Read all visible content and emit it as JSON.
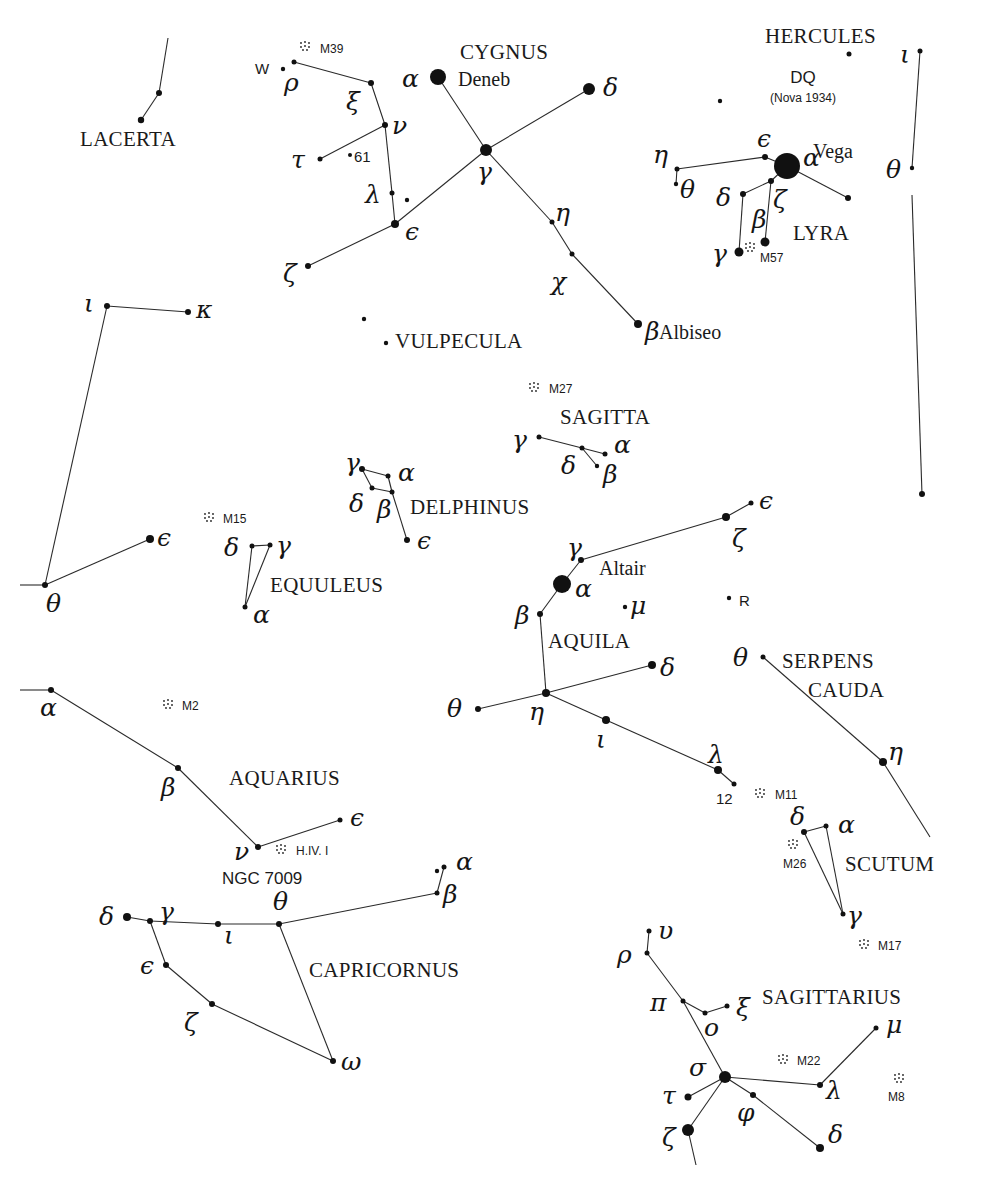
{
  "constellations": [
    {
      "name": "LACERTA",
      "x": 80,
      "y": 146
    },
    {
      "name": "CYGNUS",
      "x": 460,
      "y": 59
    },
    {
      "name": "HERCULES",
      "x": 765,
      "y": 43
    },
    {
      "name": "LYRA",
      "x": 793,
      "y": 240
    },
    {
      "name": "VULPECULA",
      "x": 395,
      "y": 348
    },
    {
      "name": "SAGITTA",
      "x": 560,
      "y": 424
    },
    {
      "name": "DELPHINUS",
      "x": 410,
      "y": 514
    },
    {
      "name": "EQUULEUS",
      "x": 270,
      "y": 592
    },
    {
      "name": "AQUILA",
      "x": 548,
      "y": 648
    },
    {
      "name": "SERPENS",
      "x": 782,
      "y": 668
    },
    {
      "name": "CAUDA",
      "x": 808,
      "y": 697
    },
    {
      "name": "AQUARIUS",
      "x": 229,
      "y": 785
    },
    {
      "name": "SCUTUM",
      "x": 845,
      "y": 871
    },
    {
      "name": "CAPRICORNUS",
      "x": 309,
      "y": 977
    },
    {
      "name": "SAGITTARIUS",
      "x": 762,
      "y": 1004
    }
  ],
  "star_names": [
    {
      "name": "Deneb",
      "x": 458,
      "y": 86
    },
    {
      "name": "Vega",
      "x": 813,
      "y": 158
    },
    {
      "name": "Albiseo",
      "x": 659,
      "y": 339
    },
    {
      "name": "Altair",
      "x": 599,
      "y": 575
    }
  ],
  "variables": [
    {
      "name": "DQ",
      "x": 803,
      "y": 83,
      "cls": "big"
    },
    {
      "name": "(Nova 1934)",
      "x": 803,
      "y": 102,
      "cls": "sm"
    },
    {
      "name": "W",
      "x": 255,
      "y": 74,
      "cls": "smd"
    },
    {
      "name": "61",
      "x": 354,
      "y": 162,
      "cls": "smd"
    },
    {
      "name": "R",
      "x": 739,
      "y": 606,
      "cls": "smd"
    },
    {
      "name": "12",
      "x": 716,
      "y": 804,
      "cls": "smd"
    },
    {
      "name": "NGC 7009",
      "x": 222,
      "y": 884,
      "cls": "big"
    }
  ],
  "deep_sky": [
    {
      "label": "M39",
      "x": 305,
      "y": 46,
      "lx": 320,
      "ly": 53
    },
    {
      "label": "M57",
      "x": 750,
      "y": 247,
      "lx": 760,
      "ly": 262
    },
    {
      "label": "M27",
      "x": 534,
      "y": 387,
      "lx": 549,
      "ly": 393
    },
    {
      "label": "M15",
      "x": 209,
      "y": 517,
      "lx": 223,
      "ly": 523
    },
    {
      "label": "M2",
      "x": 168,
      "y": 704,
      "lx": 182,
      "ly": 710
    },
    {
      "label": "H.IV. I",
      "x": 281,
      "y": 849,
      "lx": 296,
      "ly": 855
    },
    {
      "label": "M11",
      "x": 760,
      "y": 793,
      "lx": 775,
      "ly": 799
    },
    {
      "label": "M26",
      "x": 793,
      "y": 844,
      "lx": 783,
      "ly": 868
    },
    {
      "label": "M17",
      "x": 864,
      "y": 944,
      "lx": 878,
      "ly": 950
    },
    {
      "label": "M22",
      "x": 783,
      "y": 1059,
      "lx": 797,
      "ly": 1065
    },
    {
      "label": "M8",
      "x": 899,
      "y": 1078,
      "lx": 888,
      "ly": 1101
    }
  ],
  "stars": [
    {
      "id": "lac1",
      "x": 159,
      "y": 93,
      "r": 3
    },
    {
      "id": "lac2",
      "x": 141,
      "y": 120,
      "r": 3.2
    },
    {
      "id": "cyg_w",
      "x": 283,
      "y": 69,
      "r": 2.2
    },
    {
      "id": "cyg_rho",
      "x": 294,
      "y": 62,
      "r": 2.5,
      "g": "ρ",
      "gx": 284,
      "gy": 91
    },
    {
      "id": "cyg_xi",
      "x": 371,
      "y": 83,
      "r": 3,
      "g": "ξ",
      "gx": 346,
      "gy": 110
    },
    {
      "id": "cyg_nu",
      "x": 385,
      "y": 125,
      "r": 3,
      "g": "ν",
      "gx": 392,
      "gy": 134
    },
    {
      "id": "cyg_tau",
      "x": 320,
      "y": 159,
      "r": 2.5,
      "g": "τ",
      "gx": 291,
      "gy": 168
    },
    {
      "id": "cyg_61",
      "x": 350,
      "y": 155,
      "r": 2
    },
    {
      "id": "cyg_lambda",
      "x": 392,
      "y": 193,
      "r": 2.5,
      "g": "λ",
      "gx": 365,
      "gy": 203
    },
    {
      "id": "cyg_x",
      "x": 407,
      "y": 200,
      "r": 2.2
    },
    {
      "id": "cyg_eps",
      "x": 395,
      "y": 224,
      "r": 4,
      "g": "ϵ",
      "gx": 405,
      "gy": 240
    },
    {
      "id": "cyg_zeta",
      "x": 308,
      "y": 266,
      "r": 3,
      "g": "ζ",
      "gx": 283,
      "gy": 282
    },
    {
      "id": "cyg_alpha",
      "x": 438,
      "y": 77,
      "r": 8,
      "g": "α",
      "gx": 402,
      "gy": 87
    },
    {
      "id": "cyg_gamma",
      "x": 486,
      "y": 150,
      "r": 6,
      "g": "γ",
      "gx": 477,
      "gy": 180
    },
    {
      "id": "cyg_delta",
      "x": 589,
      "y": 89,
      "r": 6,
      "g": "δ",
      "gx": 603,
      "gy": 96
    },
    {
      "id": "cyg_eta",
      "x": 552,
      "y": 222,
      "r": 2.5,
      "g": "η",
      "gx": 555,
      "gy": 221
    },
    {
      "id": "cyg_chi",
      "x": 572,
      "y": 254,
      "r": 2.5,
      "g": "χ",
      "gx": 551,
      "gy": 290
    },
    {
      "id": "cyg_beta",
      "x": 638,
      "y": 324,
      "r": 4,
      "g": "β",
      "gx": 645,
      "gy": 340
    },
    {
      "id": "her_dq",
      "x": 849,
      "y": 54,
      "r": 2.5
    },
    {
      "id": "her_x",
      "x": 720,
      "y": 101,
      "r": 2.2
    },
    {
      "id": "her_iota",
      "x": 920,
      "y": 51,
      "r": 2.5,
      "g": "ι",
      "gx": 900,
      "gy": 63
    },
    {
      "id": "her_theta",
      "x": 912,
      "y": 168,
      "r": 2.2,
      "g": "θ",
      "gx": 886,
      "gy": 178
    },
    {
      "id": "her_low",
      "x": 922,
      "y": 494,
      "r": 3
    },
    {
      "id": "lyr_alpha",
      "x": 787,
      "y": 166,
      "r": 13,
      "g": "α",
      "gx": 803,
      "gy": 166
    },
    {
      "id": "lyr_eps",
      "x": 765,
      "y": 157,
      "r": 3,
      "g": "ϵ",
      "gx": 757,
      "gy": 147
    },
    {
      "id": "lyr_eta",
      "x": 677,
      "y": 169,
      "r": 2.5,
      "g": "η",
      "gx": 653,
      "gy": 163
    },
    {
      "id": "lyr_theta",
      "x": 676,
      "y": 184,
      "r": 2.2,
      "g": "θ",
      "gx": 680,
      "gy": 198
    },
    {
      "id": "lyr_zeta",
      "x": 771,
      "y": 181,
      "r": 3,
      "g": "ζ",
      "gx": 773,
      "gy": 208
    },
    {
      "id": "lyr_delta",
      "x": 743,
      "y": 194,
      "r": 3,
      "g": "δ",
      "gx": 716,
      "gy": 206
    },
    {
      "id": "lyr_epsx",
      "x": 848,
      "y": 198,
      "r": 3
    },
    {
      "id": "lyr_gamma",
      "x": 739,
      "y": 252,
      "r": 4.5,
      "g": "γ",
      "gx": 712,
      "gy": 262
    },
    {
      "id": "lyr_beta",
      "x": 765,
      "y": 242,
      "r": 4.5,
      "g": "β",
      "gx": 752,
      "gy": 228
    },
    {
      "id": "peg_iota",
      "x": 107,
      "y": 306,
      "r": 3,
      "g": "ι",
      "gx": 84,
      "gy": 312
    },
    {
      "id": "peg_kappa",
      "x": 188,
      "y": 312,
      "r": 3,
      "g": "κ",
      "gx": 196,
      "gy": 318
    },
    {
      "id": "peg_eps",
      "x": 150,
      "y": 539,
      "r": 4,
      "g": "ϵ",
      "gx": 157,
      "gy": 546
    },
    {
      "id": "peg_theta",
      "x": 45,
      "y": 585,
      "r": 3,
      "g": "θ",
      "gx": 46,
      "gy": 612
    },
    {
      "id": "vul1",
      "x": 364,
      "y": 319,
      "r": 2.2
    },
    {
      "id": "vul2",
      "x": 386,
      "y": 343,
      "r": 2.2
    },
    {
      "id": "sge_gamma",
      "x": 539,
      "y": 437,
      "r": 2.5,
      "g": "γ",
      "gx": 512,
      "gy": 448
    },
    {
      "id": "sge_delta",
      "x": 582,
      "y": 448,
      "r": 2.5,
      "g": "δ",
      "gx": 561,
      "gy": 474
    },
    {
      "id": "sge_alpha",
      "x": 605,
      "y": 454,
      "r": 2.5,
      "g": "α",
      "gx": 614,
      "gy": 453
    },
    {
      "id": "sge_beta",
      "x": 597,
      "y": 466,
      "r": 2.2,
      "g": "β",
      "gx": 603,
      "gy": 483
    },
    {
      "id": "del_gamma",
      "x": 362,
      "y": 469,
      "r": 3,
      "g": "γ",
      "gx": 345,
      "gy": 471
    },
    {
      "id": "del_alpha",
      "x": 388,
      "y": 476,
      "r": 2.5,
      "g": "α",
      "gx": 398,
      "gy": 481
    },
    {
      "id": "del_delta",
      "x": 372,
      "y": 488,
      "r": 2.5,
      "g": "δ",
      "gx": 349,
      "gy": 512
    },
    {
      "id": "del_beta",
      "x": 392,
      "y": 492,
      "r": 2.5,
      "g": "β",
      "gx": 377,
      "gy": 518
    },
    {
      "id": "del_eps",
      "x": 407,
      "y": 540,
      "r": 3,
      "g": "ϵ",
      "gx": 417,
      "gy": 549
    },
    {
      "id": "equ_delta",
      "x": 252,
      "y": 546,
      "r": 2.5,
      "g": "δ",
      "gx": 224,
      "gy": 556
    },
    {
      "id": "equ_gamma",
      "x": 270,
      "y": 545,
      "r": 2.5,
      "g": "γ",
      "gx": 276,
      "gy": 554
    },
    {
      "id": "equ_alpha",
      "x": 245,
      "y": 607,
      "r": 2.5,
      "g": "α",
      "gx": 253,
      "gy": 623
    },
    {
      "id": "aql_eps",
      "x": 751,
      "y": 503,
      "r": 2.5,
      "g": "ϵ",
      "gx": 759,
      "gy": 509
    },
    {
      "id": "aql_zeta",
      "x": 726,
      "y": 517,
      "r": 4,
      "g": "ζ",
      "gx": 732,
      "gy": 547
    },
    {
      "id": "aql_gamma",
      "x": 581,
      "y": 560,
      "r": 3,
      "g": "γ",
      "gx": 567,
      "gy": 556
    },
    {
      "id": "aql_alpha",
      "x": 562,
      "y": 584,
      "r": 9,
      "g": "α",
      "gx": 575,
      "gy": 597
    },
    {
      "id": "aql_mu",
      "x": 625,
      "y": 607,
      "r": 2.2,
      "g": "μ",
      "gx": 630,
      "gy": 614
    },
    {
      "id": "aql_r",
      "x": 729,
      "y": 598,
      "r": 2.2
    },
    {
      "id": "aql_beta",
      "x": 540,
      "y": 614,
      "r": 3,
      "g": "β",
      "gx": 515,
      "gy": 624
    },
    {
      "id": "aql_delta",
      "x": 652,
      "y": 665,
      "r": 4,
      "g": "δ",
      "gx": 660,
      "gy": 676
    },
    {
      "id": "aql_eta",
      "x": 546,
      "y": 693,
      "r": 4,
      "g": "η",
      "gx": 529,
      "gy": 720
    },
    {
      "id": "aql_theta",
      "x": 478,
      "y": 709,
      "r": 3,
      "g": "θ",
      "gx": 447,
      "gy": 717
    },
    {
      "id": "aql_iota",
      "x": 606,
      "y": 720,
      "r": 4,
      "g": "ι",
      "gx": 596,
      "gy": 748
    },
    {
      "id": "aql_lambda",
      "x": 718,
      "y": 770,
      "r": 4,
      "g": "λ",
      "gx": 708,
      "gy": 763
    },
    {
      "id": "aql_12",
      "x": 734,
      "y": 784,
      "r": 2.5
    },
    {
      "id": "ser_theta",
      "x": 763,
      "y": 657,
      "r": 2.5,
      "g": "θ",
      "gx": 733,
      "gy": 666
    },
    {
      "id": "ser_eta",
      "x": 883,
      "y": 762,
      "r": 4,
      "g": "η",
      "gx": 888,
      "gy": 760
    },
    {
      "id": "aqr_alpha",
      "x": 51,
      "y": 690,
      "r": 3,
      "g": "α",
      "gx": 40,
      "gy": 716
    },
    {
      "id": "aqr_beta",
      "x": 178,
      "y": 768,
      "r": 3,
      "g": "β",
      "gx": 161,
      "gy": 796
    },
    {
      "id": "aqr_nu",
      "x": 258,
      "y": 847,
      "r": 3,
      "g": "ν",
      "gx": 234,
      "gy": 860
    },
    {
      "id": "aqr_eps",
      "x": 340,
      "y": 820,
      "r": 2.5,
      "g": "ϵ",
      "gx": 350,
      "gy": 826
    },
    {
      "id": "sct_delta",
      "x": 804,
      "y": 832,
      "r": 3,
      "g": "δ",
      "gx": 790,
      "gy": 825
    },
    {
      "id": "sct_alpha",
      "x": 826,
      "y": 826,
      "r": 2.5,
      "g": "α",
      "gx": 838,
      "gy": 833
    },
    {
      "id": "sct_gamma",
      "x": 843,
      "y": 914,
      "r": 2.5,
      "g": "γ",
      "gx": 847,
      "gy": 924
    },
    {
      "id": "cap_alpha",
      "x": 444,
      "y": 867,
      "r": 2.5,
      "g": "α",
      "gx": 456,
      "gy": 870
    },
    {
      "id": "cap_alpha2",
      "x": 437,
      "y": 871,
      "r": 2.2
    },
    {
      "id": "cap_beta",
      "x": 437,
      "y": 893,
      "r": 2.5,
      "g": "β",
      "gx": 443,
      "gy": 903
    },
    {
      "id": "cap_theta",
      "x": 279,
      "y": 924,
      "r": 3,
      "g": "θ",
      "gx": 273,
      "gy": 910
    },
    {
      "id": "cap_iota",
      "x": 218,
      "y": 924,
      "r": 3,
      "g": "ι",
      "gx": 224,
      "gy": 944
    },
    {
      "id": "cap_gamma",
      "x": 150,
      "y": 921,
      "r": 3,
      "g": "γ",
      "gx": 159,
      "gy": 920
    },
    {
      "id": "cap_delta",
      "x": 127,
      "y": 917,
      "r": 4,
      "g": "δ",
      "gx": 99,
      "gy": 925
    },
    {
      "id": "cap_eps",
      "x": 166,
      "y": 965,
      "r": 3,
      "g": "ϵ",
      "gx": 140,
      "gy": 974
    },
    {
      "id": "cap_zeta",
      "x": 212,
      "y": 1004,
      "r": 3,
      "g": "ζ",
      "gx": 184,
      "gy": 1031
    },
    {
      "id": "cap_omega",
      "x": 333,
      "y": 1061,
      "r": 3,
      "g": "ω",
      "gx": 341,
      "gy": 1070
    },
    {
      "id": "sgr_upsilon",
      "x": 649,
      "y": 931,
      "r": 2.5,
      "g": "υ",
      "gx": 658,
      "gy": 939
    },
    {
      "id": "sgr_rho",
      "x": 647,
      "y": 953,
      "r": 2.5,
      "g": "ρ",
      "gx": 617,
      "gy": 963
    },
    {
      "id": "sgr_pi",
      "x": 683,
      "y": 1001,
      "r": 2.5,
      "g": "π",
      "gx": 650,
      "gy": 1011
    },
    {
      "id": "sgr_o",
      "x": 705,
      "y": 1013,
      "r": 2.5,
      "g": "ο",
      "gx": 704,
      "gy": 1036
    },
    {
      "id": "sgr_xi",
      "x": 727,
      "y": 1006,
      "r": 2.5,
      "g": "ξ",
      "gx": 736,
      "gy": 1016
    },
    {
      "id": "sgr_mu",
      "x": 876,
      "y": 1028,
      "r": 2.5,
      "g": "μ",
      "gx": 886,
      "gy": 1033
    },
    {
      "id": "sgr_sigma",
      "x": 725,
      "y": 1077,
      "r": 6,
      "g": "σ",
      "gx": 689,
      "gy": 1076
    },
    {
      "id": "sgr_lambda",
      "x": 820,
      "y": 1085,
      "r": 3,
      "g": "λ",
      "gx": 826,
      "gy": 1099
    },
    {
      "id": "sgr_tau",
      "x": 688,
      "y": 1097,
      "r": 3.5,
      "g": "τ",
      "gx": 662,
      "gy": 1104
    },
    {
      "id": "sgr_phi",
      "x": 753,
      "y": 1095,
      "r": 3,
      "g": "φ",
      "gx": 737,
      "gy": 1121
    },
    {
      "id": "sgr_zeta",
      "x": 688,
      "y": 1130,
      "r": 6,
      "g": "ζ",
      "gx": 662,
      "gy": 1146
    },
    {
      "id": "sgr_delta",
      "x": 820,
      "y": 1148,
      "r": 4,
      "g": "δ",
      "gx": 828,
      "gy": 1143
    }
  ],
  "lines": [
    [
      168,
      38,
      159,
      93
    ],
    [
      159,
      93,
      141,
      120
    ],
    [
      294,
      62,
      371,
      83
    ],
    [
      371,
      83,
      385,
      125
    ],
    [
      385,
      125,
      320,
      159
    ],
    [
      385,
      125,
      392,
      193
    ],
    [
      392,
      193,
      395,
      224
    ],
    [
      395,
      224,
      308,
      266
    ],
    [
      438,
      77,
      486,
      150
    ],
    [
      486,
      150,
      589,
      89
    ],
    [
      486,
      150,
      395,
      224
    ],
    [
      486,
      150,
      552,
      222
    ],
    [
      552,
      222,
      572,
      254
    ],
    [
      572,
      254,
      638,
      324
    ],
    [
      920,
      51,
      912,
      168
    ],
    [
      912,
      195,
      922,
      494
    ],
    [
      787,
      166,
      765,
      157
    ],
    [
      765,
      157,
      677,
      169
    ],
    [
      677,
      169,
      676,
      184
    ],
    [
      787,
      166,
      848,
      198
    ],
    [
      787,
      166,
      771,
      181
    ],
    [
      771,
      181,
      743,
      194
    ],
    [
      743,
      194,
      739,
      252
    ],
    [
      771,
      181,
      765,
      242
    ],
    [
      107,
      306,
      188,
      312
    ],
    [
      107,
      306,
      45,
      585
    ],
    [
      45,
      585,
      150,
      539
    ],
    [
      20,
      585,
      45,
      585
    ],
    [
      539,
      437,
      582,
      448
    ],
    [
      582,
      448,
      605,
      454
    ],
    [
      582,
      448,
      597,
      466
    ],
    [
      362,
      469,
      388,
      476
    ],
    [
      362,
      469,
      372,
      488
    ],
    [
      372,
      488,
      392,
      492
    ],
    [
      392,
      492,
      388,
      476
    ],
    [
      392,
      492,
      407,
      540
    ],
    [
      252,
      546,
      270,
      545
    ],
    [
      252,
      546,
      245,
      607
    ],
    [
      270,
      545,
      245,
      607
    ],
    [
      751,
      503,
      726,
      517
    ],
    [
      726,
      517,
      581,
      560
    ],
    [
      581,
      560,
      562,
      584
    ],
    [
      562,
      584,
      540,
      614
    ],
    [
      540,
      614,
      546,
      693
    ],
    [
      546,
      693,
      652,
      665
    ],
    [
      546,
      693,
      478,
      709
    ],
    [
      546,
      693,
      606,
      720
    ],
    [
      606,
      720,
      718,
      770
    ],
    [
      718,
      770,
      734,
      784
    ],
    [
      763,
      657,
      883,
      762
    ],
    [
      883,
      762,
      930,
      837
    ],
    [
      20,
      690,
      51,
      690
    ],
    [
      51,
      690,
      178,
      768
    ],
    [
      178,
      768,
      258,
      847
    ],
    [
      258,
      847,
      340,
      820
    ],
    [
      804,
      832,
      826,
      826
    ],
    [
      804,
      832,
      843,
      914
    ],
    [
      826,
      826,
      843,
      914
    ],
    [
      444,
      867,
      437,
      893
    ],
    [
      437,
      893,
      279,
      924
    ],
    [
      279,
      924,
      218,
      924
    ],
    [
      218,
      924,
      150,
      921
    ],
    [
      150,
      921,
      127,
      917
    ],
    [
      150,
      921,
      166,
      965
    ],
    [
      166,
      965,
      212,
      1004
    ],
    [
      212,
      1004,
      333,
      1061
    ],
    [
      279,
      924,
      333,
      1061
    ],
    [
      649,
      931,
      647,
      953
    ],
    [
      647,
      953,
      683,
      1001
    ],
    [
      683,
      1001,
      705,
      1013
    ],
    [
      705,
      1013,
      727,
      1006
    ],
    [
      683,
      1001,
      725,
      1077
    ],
    [
      725,
      1077,
      820,
      1085
    ],
    [
      820,
      1085,
      876,
      1028
    ],
    [
      725,
      1077,
      688,
      1097
    ],
    [
      725,
      1077,
      688,
      1130
    ],
    [
      688,
      1130,
      696,
      1165
    ],
    [
      725,
      1077,
      753,
      1095
    ],
    [
      753,
      1095,
      820,
      1148
    ]
  ]
}
